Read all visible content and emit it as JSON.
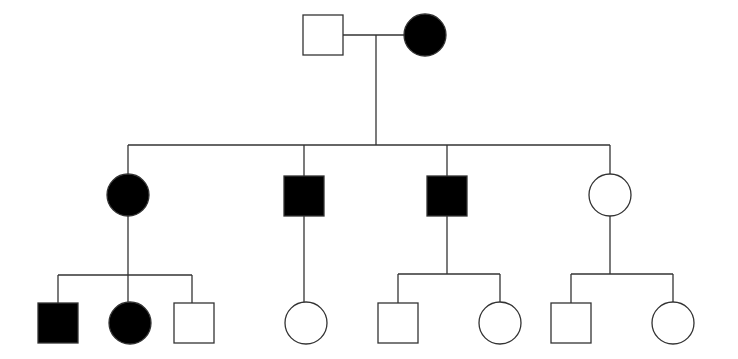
{
  "diagram": {
    "type": "pedigree",
    "colors": {
      "affected": "#000000",
      "unaffected": "#ffffff",
      "line": "#333333"
    },
    "individuals": [
      {
        "id": "I-1",
        "sex": "male",
        "affected": false,
        "x": 323,
        "y": 35
      },
      {
        "id": "I-2",
        "sex": "female",
        "affected": true,
        "x": 425,
        "y": 35
      },
      {
        "id": "II-1",
        "sex": "female",
        "affected": true,
        "x": 128,
        "y": 195
      },
      {
        "id": "II-2",
        "sex": "male",
        "affected": true,
        "x": 304,
        "y": 196
      },
      {
        "id": "II-3",
        "sex": "male",
        "affected": true,
        "x": 447,
        "y": 196
      },
      {
        "id": "II-4",
        "sex": "female",
        "affected": false,
        "x": 610,
        "y": 195
      },
      {
        "id": "III-1",
        "sex": "male",
        "affected": true,
        "x": 58,
        "y": 323
      },
      {
        "id": "III-2",
        "sex": "female",
        "affected": true,
        "x": 130,
        "y": 323
      },
      {
        "id": "III-3",
        "sex": "male",
        "affected": false,
        "x": 194,
        "y": 323
      },
      {
        "id": "III-4",
        "sex": "female",
        "affected": false,
        "x": 306,
        "y": 323
      },
      {
        "id": "III-5",
        "sex": "male",
        "affected": false,
        "x": 398,
        "y": 323
      },
      {
        "id": "III-6",
        "sex": "female",
        "affected": false,
        "x": 500,
        "y": 323
      },
      {
        "id": "III-7",
        "sex": "male",
        "affected": false,
        "x": 571,
        "y": 323
      },
      {
        "id": "III-8",
        "sex": "female",
        "affected": false,
        "x": 673,
        "y": 323
      }
    ]
  }
}
